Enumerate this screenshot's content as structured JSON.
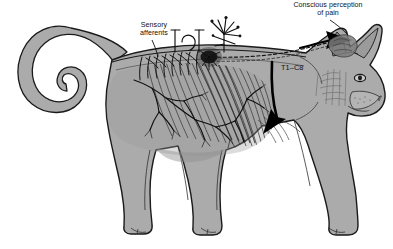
{
  "figure": {
    "view": "lateral / side profile, facing right",
    "background_color": "#ffffff",
    "body_fill_color": "#ababab",
    "outline_color": "#111111",
    "muscle_shading_color": "#4a4a4a",
    "nerve_color": "#111111",
    "arrow_color": "#000000"
  },
  "labels": {
    "conscious_perception": {
      "line1": "Conscious perception",
      "line2": "of pain",
      "text": "Conscious perception of pain"
    },
    "sensory_afferents": {
      "line1": "Sensory",
      "line2": "afferents",
      "text": "Sensory afferents"
    },
    "spinal_segments": {
      "text": "T1–C8"
    }
  },
  "annotations": {
    "leader_lines": [
      {
        "name": "sensory-afferents-leader",
        "from": "Sensory afferents label",
        "to": "dorsal nerve roots along thoracolumbar spine"
      },
      {
        "name": "conscious-perception-leader",
        "from": "Conscious perception of pain label",
        "to": "brain / cranium"
      }
    ],
    "arrows": [
      {
        "name": "ascending-pathway-arrow",
        "direction": "rightward into the brain",
        "style": "solid black block arrow with dashed tail along spinal cord"
      },
      {
        "name": "descending-pathway-arrow",
        "direction": "downward curving into the shoulder/thorax",
        "style": "solid black curved arrow"
      }
    ],
    "structures": [
      {
        "name": "dorsal-root-ganglia",
        "description": "row of small nerve rootlets branching off the spinal cord"
      },
      {
        "name": "free-nerve-endings",
        "description": "branching nociceptor terminals above the dorsum"
      },
      {
        "name": "nerve-plexus-blotch",
        "description": "dark concentrated nerve plexus over the mid back"
      },
      {
        "name": "thoracic-musculature",
        "description": "striated shoulder and flank muscle fibers with branching vasculature"
      },
      {
        "name": "spinal-cord",
        "description": "dashed tract running cranially from thoracic spine to brain"
      },
      {
        "name": "curled-tail",
        "description": "tail curved into a loop at the caudal end"
      }
    ]
  }
}
